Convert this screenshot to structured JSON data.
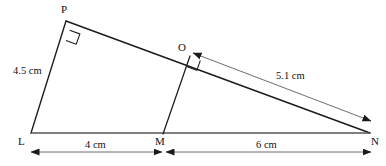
{
  "figure": {
    "type": "geometry-diagram",
    "shape": "triangle with internal perpendicular",
    "width": 386,
    "height": 166,
    "stroke_color": "#1a1a1a",
    "text_color": "#111111",
    "background_color": "#ffffff"
  },
  "vertices": [
    {
      "id": "L",
      "label": "L",
      "x": 31,
      "y": 133,
      "label_x": 18,
      "label_y": 136
    },
    {
      "id": "M",
      "label": "M",
      "x": 163,
      "y": 134,
      "label_x": 155,
      "label_y": 136
    },
    {
      "id": "N",
      "label": "N",
      "x": 370,
      "y": 133,
      "label_x": 371,
      "label_y": 136
    },
    {
      "id": "P",
      "label": "P",
      "x": 66,
      "y": 21,
      "label_x": 61,
      "label_y": 4
    },
    {
      "id": "O",
      "label": "O",
      "x": 190,
      "y": 56,
      "label_x": 178,
      "label_y": 42
    }
  ],
  "segments": [
    {
      "name": "side-LP",
      "from": "L",
      "to": "P"
    },
    {
      "name": "side-PN",
      "from": "P",
      "to": "N"
    },
    {
      "name": "base-LN",
      "from": "L",
      "to": "N"
    },
    {
      "name": "altitude-MO",
      "from": "M",
      "to": "O"
    }
  ],
  "right_angles": [
    {
      "name": "right-angle-at-P",
      "at": "P"
    },
    {
      "name": "right-angle-at-O",
      "at": "O"
    }
  ],
  "measurements": [
    {
      "id": "len-LP",
      "label": "4.5 cm",
      "refers_to": "LP",
      "label_x": 13,
      "label_y": 66,
      "has_arrow": false
    },
    {
      "id": "len-ON",
      "label": "5.1 cm",
      "refers_to": "ON",
      "label_x": 276,
      "label_y": 71,
      "has_arrow": true,
      "arrow_from": {
        "x": 193,
        "y": 53
      },
      "arrow_to": {
        "x": 371,
        "y": 121
      }
    },
    {
      "id": "len-LM",
      "label": "4 cm",
      "refers_to": "LM",
      "label_x": 85,
      "label_y": 140,
      "has_arrow": true,
      "arrow_from": {
        "x": 31,
        "y": 152
      },
      "arrow_to": {
        "x": 162,
        "y": 152
      }
    },
    {
      "id": "len-MN",
      "label": "6 cm",
      "refers_to": "MN",
      "label_x": 256,
      "label_y": 140,
      "has_arrow": true,
      "arrow_from": {
        "x": 166,
        "y": 152
      },
      "arrow_to": {
        "x": 371,
        "y": 152
      }
    }
  ]
}
